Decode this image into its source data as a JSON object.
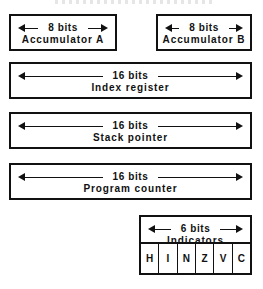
{
  "diagram": {
    "title": "",
    "registers": [
      {
        "id": "accumulator-a",
        "bits_label": "8 bits",
        "name": "Accumulator A",
        "x": 9,
        "y": 14,
        "w": 108,
        "h": 37
      },
      {
        "id": "accumulator-b",
        "bits_label": "8 bits",
        "name": "Accumulator B",
        "x": 156,
        "y": 14,
        "w": 96,
        "h": 37
      },
      {
        "id": "index-register",
        "bits_label": "16 bits",
        "name": "Index register",
        "x": 9,
        "y": 62,
        "w": 243,
        "h": 37
      },
      {
        "id": "stack-pointer",
        "bits_label": "16 bits",
        "name": "Stack pointer",
        "x": 9,
        "y": 112,
        "w": 243,
        "h": 37
      },
      {
        "id": "program-counter",
        "bits_label": "16 bits",
        "name": "Program counter",
        "x": 9,
        "y": 163,
        "w": 243,
        "h": 37
      }
    ],
    "indicators": {
      "id": "indicators",
      "bits_label": "6 bits",
      "name": "Indicators",
      "x": 139,
      "y": 215,
      "w": 113,
      "h": 60,
      "flags": [
        "H",
        "I",
        "N",
        "Z",
        "V",
        "C"
      ]
    },
    "colors": {
      "ink": "#111111",
      "paper": "#ffffff"
    }
  }
}
